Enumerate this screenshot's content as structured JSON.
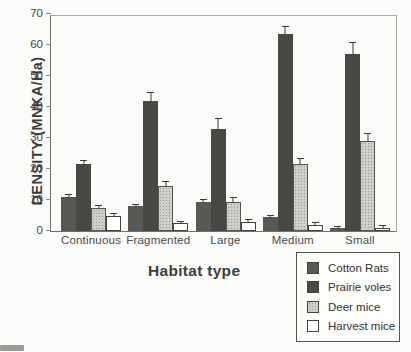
{
  "chart_data": {
    "type": "bar",
    "title": "",
    "xlabel": "Habitat type",
    "ylabel": "DENSITY (MNKA/Ha)",
    "ylim": [
      0,
      70
    ],
    "yticks": [
      0,
      10,
      20,
      30,
      40,
      50,
      60,
      70
    ],
    "grid": false,
    "legend_position": "bottom-right",
    "error_bars": "upper",
    "categories": [
      "Continuous",
      "Fragmented",
      "Large",
      "Medium",
      "Small"
    ],
    "series": [
      {
        "name": "Cotton Rats",
        "color": "#585854",
        "pattern": "solid",
        "values": [
          11,
          8,
          9.5,
          4.5,
          1
        ],
        "errors": [
          1,
          0.8,
          0.8,
          0.8,
          0.5
        ]
      },
      {
        "name": "Prairie voles",
        "color": "#484844",
        "pattern": "solid",
        "values": [
          21.5,
          42,
          33,
          63.5,
          57
        ],
        "errors": [
          1.5,
          3,
          3.5,
          2.5,
          4
        ]
      },
      {
        "name": "Deer mice",
        "color": "#cfcfca",
        "pattern": "stipple",
        "values": [
          7.5,
          14.5,
          9.5,
          21.5,
          29
        ],
        "errors": [
          0.8,
          1.5,
          1.5,
          2,
          2.5
        ]
      },
      {
        "name": "Harvest mice",
        "color": "#ffffff",
        "pattern": "solid",
        "values": [
          5,
          2.5,
          3,
          2,
          1
        ],
        "errors": [
          0.8,
          0.8,
          0.8,
          0.8,
          0.8
        ]
      }
    ]
  },
  "layout": {
    "px_per_unit": 3.1,
    "bar_width_px": 15
  }
}
